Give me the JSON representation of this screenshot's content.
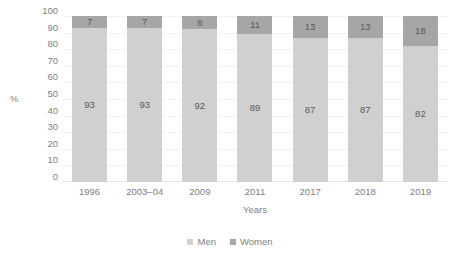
{
  "chart_data": {
    "type": "bar",
    "subtype": "stacked-100-percent",
    "title": "",
    "xlabel": "Years",
    "ylabel": "%",
    "ylim": [
      0,
      100
    ],
    "yticks": [
      100,
      90,
      80,
      70,
      60,
      50,
      40,
      30,
      20,
      10,
      0
    ],
    "grid": true,
    "legend_position": "bottom",
    "categories": [
      "1996",
      "2003–04",
      "2009",
      "2011",
      "2017",
      "2018",
      "2019"
    ],
    "series": [
      {
        "name": "Men",
        "color": "#d0d0d0",
        "values": [
          93,
          93,
          92,
          89,
          87,
          87,
          82
        ]
      },
      {
        "name": "Women",
        "color": "#a6a6a6",
        "values": [
          7,
          7,
          8,
          11,
          13,
          13,
          18
        ]
      }
    ]
  },
  "axes": {
    "y_title": "%",
    "x_title": "Years",
    "y_ticks": [
      "100",
      "90",
      "80",
      "70",
      "60",
      "50",
      "40",
      "30",
      "20",
      "10",
      "0"
    ],
    "x_ticks": [
      "1996",
      "2003–04",
      "2009",
      "2011",
      "2017",
      "2018",
      "2019"
    ]
  },
  "bars": [
    {
      "category": "1996",
      "men": "93",
      "women": "7"
    },
    {
      "category": "2003–04",
      "men": "93",
      "women": "7"
    },
    {
      "category": "2009",
      "men": "92",
      "women": "8"
    },
    {
      "category": "2011",
      "men": "89",
      "women": "11"
    },
    {
      "category": "2017",
      "men": "87",
      "women": "13"
    },
    {
      "category": "2018",
      "men": "87",
      "women": "13"
    },
    {
      "category": "2019",
      "men": "82",
      "women": "18"
    }
  ],
  "legend": {
    "items": [
      {
        "label": "Men",
        "color": "#d0d0d0"
      },
      {
        "label": "Women",
        "color": "#a6a6a6"
      }
    ]
  }
}
